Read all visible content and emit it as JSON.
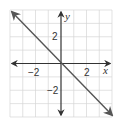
{
  "graph": {
    "type": "coordinate-plane",
    "x_range": [
      -4,
      4
    ],
    "y_range": [
      -4,
      4
    ],
    "grid_step": 1,
    "x_axis_label": "x",
    "y_axis_label": "y",
    "tick_labels": {
      "x_neg": "−2",
      "x_pos": "2",
      "y_pos": "2",
      "y_neg": "−2"
    },
    "line": {
      "equation": "y = -x",
      "slope": -1,
      "intercept": 0,
      "arrows_both_ends": true
    },
    "colors": {
      "grid": "#d0d0d0",
      "axis": "#333333",
      "line": "#555555"
    }
  }
}
